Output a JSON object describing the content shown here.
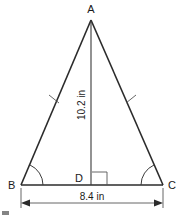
{
  "figure": {
    "type": "isosceles-triangle-with-altitude",
    "title": "",
    "background_color": "#ffffff",
    "line_color": "#2b2b2b",
    "text_color": "#1a1a1a",
    "vertices": {
      "apex_label": "A",
      "bottom_left_label": "B",
      "foot_label": "D",
      "bottom_right_label": "C"
    },
    "measurements": {
      "height_label": "10.2 in",
      "base_label": "8.4 in",
      "height_value": 10.2,
      "base_value": 8.4,
      "unit": "in"
    },
    "marks": {
      "congruent_tick_count": 1,
      "base_angle_arcs": 2,
      "right_angle_at": "D"
    },
    "geometry": {
      "A": [
        91,
        20
      ],
      "B": [
        21,
        185
      ],
      "C": [
        163,
        185
      ],
      "D": [
        91,
        185
      ],
      "dimension_line_y": 203
    }
  }
}
